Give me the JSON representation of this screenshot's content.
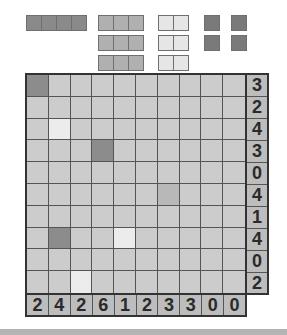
{
  "colors": {
    "ship": "#8c8c8c",
    "water": "#ececec",
    "unknown": "#cccccc",
    "hint": "#b8b8b8",
    "fleet_4": "#8a8a8a",
    "fleet_3": "#b0b0b0",
    "fleet_2": "#e6e6e6",
    "fleet_1": "#7a7a7a",
    "clue_bg": "#bdbdbd"
  },
  "fleet": [
    {
      "size": 4,
      "x": 26,
      "y": 15,
      "color": "#8a8a8a"
    },
    {
      "size": 3,
      "x": 98,
      "y": 15,
      "color": "#b0b0b0"
    },
    {
      "size": 3,
      "x": 98,
      "y": 35,
      "color": "#b0b0b0"
    },
    {
      "size": 3,
      "x": 98,
      "y": 55,
      "color": "#b0b0b0"
    },
    {
      "size": 2,
      "x": 158,
      "y": 15,
      "color": "#e6e6e6"
    },
    {
      "size": 2,
      "x": 158,
      "y": 35,
      "color": "#e6e6e6"
    },
    {
      "size": 2,
      "x": 158,
      "y": 55,
      "color": "#e6e6e6"
    },
    {
      "size": 1,
      "x": 204,
      "y": 15,
      "color": "#7a7a7a"
    },
    {
      "size": 1,
      "x": 231,
      "y": 15,
      "color": "#7a7a7a"
    },
    {
      "size": 1,
      "x": 204,
      "y": 35,
      "color": "#7a7a7a"
    },
    {
      "size": 1,
      "x": 231,
      "y": 35,
      "color": "#7a7a7a"
    }
  ],
  "grid": {
    "rows": 10,
    "cols": 10,
    "cells": [
      [
        "ship",
        "",
        "",
        "",
        "",
        "",
        "",
        "",
        "",
        ""
      ],
      [
        "",
        "",
        "",
        "",
        "",
        "",
        "",
        "",
        "",
        ""
      ],
      [
        "",
        "water",
        "",
        "",
        "",
        "",
        "",
        "",
        "",
        ""
      ],
      [
        "",
        "",
        "",
        "ship",
        "",
        "",
        "",
        "",
        "",
        ""
      ],
      [
        "",
        "",
        "",
        "",
        "",
        "",
        "",
        "",
        "",
        ""
      ],
      [
        "",
        "",
        "",
        "",
        "",
        "",
        "hint",
        "",
        "",
        ""
      ],
      [
        "",
        "",
        "",
        "",
        "",
        "",
        "",
        "",
        "",
        ""
      ],
      [
        "",
        "ship",
        "",
        "",
        "water",
        "",
        "",
        "",
        "",
        ""
      ],
      [
        "",
        "",
        "",
        "",
        "",
        "",
        "",
        "",
        "",
        ""
      ],
      [
        "",
        "",
        "water",
        "",
        "",
        "",
        "",
        "",
        "",
        ""
      ]
    ]
  },
  "row_clues": [
    "3",
    "2",
    "4",
    "3",
    "0",
    "4",
    "1",
    "4",
    "0",
    "2"
  ],
  "col_clues": [
    "2",
    "4",
    "2",
    "6",
    "1",
    "2",
    "3",
    "3",
    "0",
    "0"
  ]
}
